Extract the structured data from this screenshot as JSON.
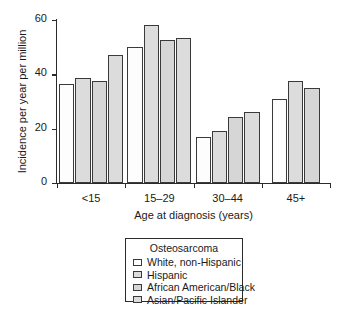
{
  "chart_data": {
    "type": "bar",
    "title": "",
    "xlabel": "Age at diagnosis (years)",
    "ylabel": "Incidence per year per million",
    "categories": [
      "<15",
      "15–29",
      "30–44",
      "45+"
    ],
    "ylim": [
      0,
      60
    ],
    "yticks": [
      0,
      20,
      40,
      60
    ],
    "grid": false,
    "legend_position": "below-center",
    "legend_title": "Osteosarcoma",
    "series": [
      {
        "name": "White, non-Hispanic",
        "color": "#fdfdfd",
        "values": [
          36.5,
          50.0,
          17.0,
          30.8
        ]
      },
      {
        "name": "Hispanic",
        "color": "#dcdcdc",
        "values": [
          38.5,
          58.0,
          19.2,
          37.5
        ]
      },
      {
        "name": "African American/Black",
        "color": "#d6d6d6",
        "values": [
          37.5,
          52.8,
          24.2,
          35.0
        ]
      },
      {
        "name": "Asian/Pacific Islander",
        "color": "#dcdcdc",
        "values": [
          47.2,
          53.2,
          26.2,
          null
        ]
      }
    ]
  },
  "axis": {
    "y_tick_labels": [
      "0",
      "20",
      "40",
      "60"
    ],
    "y_title": "Incidence per year per million",
    "x_title": "Age at diagnosis (years)",
    "x_tick_labels": [
      "<15",
      "15–29",
      "30–44",
      "45+"
    ]
  },
  "legend": {
    "title": "Osteosarcoma",
    "items": [
      {
        "label": "White, non-Hispanic"
      },
      {
        "label": "Hispanic"
      },
      {
        "label": "African American/Black"
      },
      {
        "label": "Asian/Pacific Islander"
      }
    ]
  }
}
